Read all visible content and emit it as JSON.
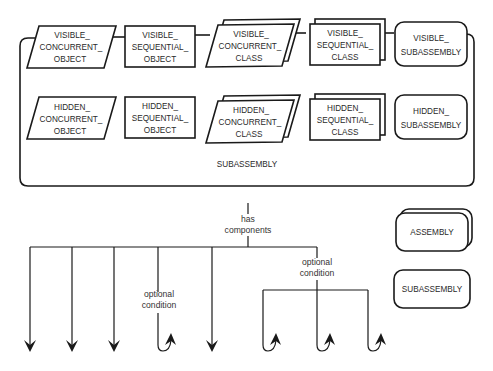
{
  "diagram": {
    "top_row": [
      {
        "shape": "parallelogram",
        "lines": [
          "VISIBLE_",
          "CONCURRENT_",
          "OBJECT"
        ]
      },
      {
        "shape": "rectangle",
        "lines": [
          "VISIBLE_",
          "SEQUENTIAL_",
          "OBJECT"
        ]
      },
      {
        "shape": "stacked-parallelogram",
        "lines": [
          "VISIBLE_",
          "CONCURRENT_",
          "CLASS"
        ]
      },
      {
        "shape": "stacked-rectangle",
        "lines": [
          "VISIBLE_",
          "SEQUENTIAL_",
          "CLASS"
        ]
      },
      {
        "shape": "rounded-rectangle",
        "lines": [
          "VISIBLE_",
          "SUBASSEMBLY"
        ]
      }
    ],
    "bottom_row": [
      {
        "shape": "parallelogram",
        "lines": [
          "HIDDEN_",
          "CONCURRENT_",
          "OBJECT"
        ]
      },
      {
        "shape": "rectangle",
        "lines": [
          "HIDDEN_",
          "SEQUENTIAL_",
          "OBJECT"
        ]
      },
      {
        "shape": "stacked-parallelogram",
        "lines": [
          "HIDDEN_",
          "CONCURRENT_",
          "CLASS"
        ]
      },
      {
        "shape": "stacked-rectangle",
        "lines": [
          "HIDDEN_",
          "SEQUENTIAL_",
          "CLASS"
        ]
      },
      {
        "shape": "rounded-rectangle",
        "lines": [
          "HIDDEN_",
          "SUBASSEMBLY"
        ]
      }
    ],
    "container_label": "SUBASSEMBLY",
    "relation_label": [
      "has",
      "components"
    ],
    "optional_labels": [
      [
        "optional",
        "condition"
      ],
      [
        "optional",
        "condition"
      ]
    ],
    "legend": [
      {
        "shape": "stacked-rounded-rectangle",
        "label": "ASSEMBLY"
      },
      {
        "shape": "rounded-rectangle",
        "label": "SUBASSEMBLY"
      }
    ]
  }
}
